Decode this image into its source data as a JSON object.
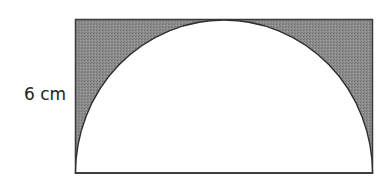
{
  "figure": {
    "side_label": "6 cm",
    "shaded_color": "#8a8a8a",
    "stroke_color": "#333333",
    "unshaded_color": "#ffffff",
    "shapes": [
      "rectangle",
      "semicircle"
    ]
  }
}
